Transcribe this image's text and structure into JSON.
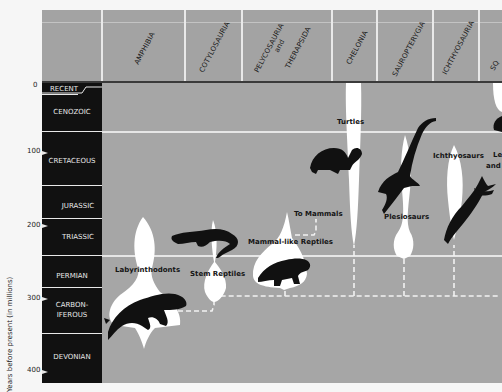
{
  "columns": [
    {
      "label": "AMPHIBIA",
      "x": 142
    },
    {
      "label": "COTYLOSAURIA",
      "x": 205
    },
    {
      "label": "PELYCOSAURIA",
      "x": 255
    },
    {
      "label": "and",
      "x": 272
    },
    {
      "label": "THERAPSIDA",
      "x": 284
    },
    {
      "label": "CHELONIA",
      "x": 350
    },
    {
      "label": "SAUROPTERYGIA",
      "x": 396
    },
    {
      "label": "ICHTHYOSAURIA",
      "x": 446
    },
    {
      "label": "SQ",
      "x": 497
    }
  ],
  "eras": [
    {
      "name": "RECENT",
      "top": 0
    },
    {
      "name": "CENOZOIC",
      "top": 20
    },
    {
      "name": "CRETACEOUS",
      "top": 66
    },
    {
      "name": "JURASSIC",
      "top": 117
    },
    {
      "name": "TRIASSIC",
      "top": 144
    },
    {
      "name": "PERMIAN",
      "top": 182
    },
    {
      "name": "CARBON-",
      "top": 215
    },
    {
      "name": "IFEROUS",
      "top": 225
    },
    {
      "name": "DEVONIAN",
      "top": 262
    }
  ],
  "axis": {
    "label": "Years before present (in millions)",
    "ticks": [
      {
        "value": "0",
        "y": 86
      },
      {
        "value": "100",
        "y": 152
      },
      {
        "value": "200",
        "y": 225
      },
      {
        "value": "300",
        "y": 298
      },
      {
        "value": "400",
        "y": 371
      }
    ]
  },
  "labels": {
    "turtles": "Turtles",
    "plesiosaurs": "Plesiosaurs",
    "ichthyosaurs": "Ichthyosaurs",
    "lepidosaurs_partial": "Le",
    "and_partial": "and",
    "to_mammals": "To Mammals",
    "mammal_like": "Mammal-like Reptiles",
    "stem_reptiles": "Stem Reptiles",
    "labyrinthodonts": "Labyrinthodonts"
  },
  "colors": {
    "background": "#a6a6a6",
    "era_bar": "#111111",
    "shape_fill": "#ffffff",
    "silhouette": "#111111"
  }
}
